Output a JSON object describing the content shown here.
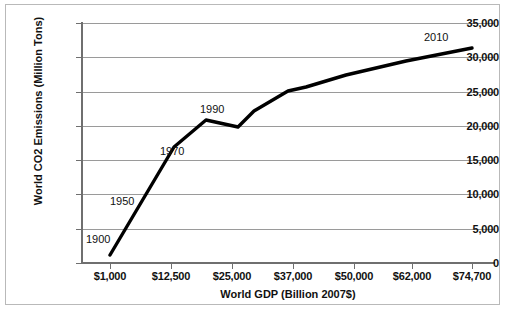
{
  "chart_data": {
    "type": "line",
    "title": "",
    "xlabel": "World GDP (Billion 2007$)",
    "ylabel": "World CO2 Emissions (Million Tons)",
    "x_tick_labels": [
      "$1,000",
      "$12,500",
      "$25,000",
      "$37,000",
      "$50,000",
      "$62,000",
      "$74,700"
    ],
    "x_tick_values": [
      1000,
      12500,
      25000,
      37000,
      50000,
      62000,
      74700
    ],
    "y_tick_labels": [
      "0",
      "5,000",
      "10,000",
      "15,000",
      "20,000",
      "25,000",
      "30,000",
      "35,000"
    ],
    "y_tick_values": [
      0,
      5000,
      10000,
      15000,
      20000,
      25000,
      30000,
      35000
    ],
    "ylim": [
      0,
      35000
    ],
    "grid": "horizontal",
    "legend": "none",
    "series": [
      {
        "name": "World CO2 Emissions vs World GDP",
        "color": "#000000",
        "x": [
          1000,
          12500,
          25000,
          37000,
          50000,
          62000,
          74700
        ],
        "y": [
          1300,
          12000,
          20000,
          24200,
          25800,
          28400,
          31500
        ]
      }
    ],
    "annotations": [
      {
        "label": "1900",
        "x_px": 80,
        "y_px": 228
      },
      {
        "label": "1950",
        "x_px": 104,
        "y_px": 190
      },
      {
        "label": "1970",
        "x_px": 154,
        "y_px": 140
      },
      {
        "label": "1990",
        "x_px": 194,
        "y_px": 98
      },
      {
        "label": "2010",
        "x_px": 418,
        "y_px": 26
      }
    ],
    "line_path_px": "M 104,250 L 168,142 L 200,115 L 232,122 L 248,106 L 282,86 L 300,82 L 340,70 L 400,56 L 466,43",
    "colors": {
      "line": "#000000",
      "gridline": "#9a9a9a",
      "axis": "#6f6f6f",
      "frame": "#b9b9b9",
      "text": "#111111",
      "background": "#ffffff"
    }
  }
}
